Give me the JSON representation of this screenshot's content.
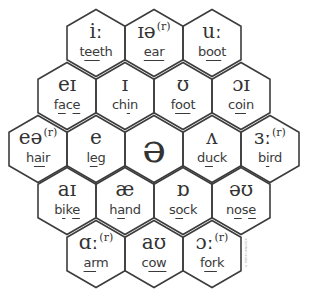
{
  "diagram": {
    "title": "",
    "type": "phonemic-chart-vowels-hexagon",
    "stroke_color": "#3c3c3c",
    "text_color": "#333333",
    "background": "#ffffff",
    "rows": [
      {
        "row": 0,
        "cells": [
          {
            "id": "teeth",
            "symbol": "iː",
            "sup": "",
            "word": "teeth",
            "parts": [
              [
                "t",
                false
              ],
              [
                "ee",
                true
              ],
              [
                "th",
                false
              ]
            ]
          },
          {
            "id": "ear",
            "symbol": "ɪə",
            "sup": "(r)",
            "word": "ear",
            "parts": [
              [
                "ear",
                true
              ]
            ]
          },
          {
            "id": "boot",
            "symbol": "uː",
            "sup": "",
            "word": "boot",
            "parts": [
              [
                "b",
                false
              ],
              [
                "oo",
                true
              ],
              [
                "t",
                false
              ]
            ]
          }
        ]
      },
      {
        "row": 1,
        "cells": [
          {
            "id": "face",
            "symbol": "eɪ",
            "sup": "",
            "word": "face",
            "parts": [
              [
                "f",
                false
              ],
              [
                "a",
                true
              ],
              [
                "c",
                false
              ],
              [
                "e",
                true
              ]
            ]
          },
          {
            "id": "chin",
            "symbol": "ɪ",
            "sup": "",
            "word": "chin",
            "parts": [
              [
                "ch",
                false
              ],
              [
                "i",
                true
              ],
              [
                "n",
                false
              ]
            ]
          },
          {
            "id": "foot",
            "symbol": "ʊ",
            "sup": "",
            "word": "foot",
            "parts": [
              [
                "f",
                false
              ],
              [
                "oo",
                true
              ],
              [
                "t",
                false
              ]
            ]
          },
          {
            "id": "coin",
            "symbol": "ɔɪ",
            "sup": "",
            "word": "coin",
            "parts": [
              [
                "c",
                false
              ],
              [
                "oi",
                true
              ],
              [
                "n",
                false
              ]
            ]
          }
        ]
      },
      {
        "row": 2,
        "cells": [
          {
            "id": "hair",
            "symbol": "eə",
            "sup": "(r)",
            "word": "hair",
            "parts": [
              [
                "h",
                false
              ],
              [
                "ai",
                true
              ],
              [
                "r",
                false
              ]
            ]
          },
          {
            "id": "leg",
            "symbol": "e",
            "sup": "",
            "word": "leg",
            "parts": [
              [
                "l",
                false
              ],
              [
                "e",
                true
              ],
              [
                "g",
                false
              ]
            ]
          },
          {
            "id": "schwa",
            "symbol": "ə",
            "sup": "",
            "word": "",
            "parts": [],
            "center": true
          },
          {
            "id": "duck",
            "symbol": "ʌ",
            "sup": "",
            "word": "duck",
            "parts": [
              [
                "d",
                false
              ],
              [
                "u",
                true
              ],
              [
                "ck",
                false
              ]
            ]
          },
          {
            "id": "bird",
            "symbol": "ɜː",
            "sup": "(r)",
            "word": "bird",
            "parts": [
              [
                "b",
                false
              ],
              [
                "i",
                true
              ],
              [
                "rd",
                false
              ]
            ]
          }
        ]
      },
      {
        "row": 3,
        "cells": [
          {
            "id": "bike",
            "symbol": "aɪ",
            "sup": "",
            "word": "bike",
            "parts": [
              [
                "b",
                false
              ],
              [
                "i",
                true
              ],
              [
                "k",
                false
              ],
              [
                "e",
                true
              ]
            ]
          },
          {
            "id": "hand",
            "symbol": "æ",
            "sup": "",
            "word": "hand",
            "parts": [
              [
                "h",
                false
              ],
              [
                "a",
                true
              ],
              [
                "nd",
                false
              ]
            ]
          },
          {
            "id": "sock",
            "symbol": "ɒ",
            "sup": "",
            "word": "sock",
            "parts": [
              [
                "s",
                false
              ],
              [
                "o",
                true
              ],
              [
                "ck",
                false
              ]
            ]
          },
          {
            "id": "nose",
            "symbol": "əʊ",
            "sup": "",
            "word": "nose",
            "parts": [
              [
                "n",
                false
              ],
              [
                "o",
                true
              ],
              [
                "s",
                false
              ],
              [
                "e",
                true
              ]
            ]
          }
        ]
      },
      {
        "row": 4,
        "cells": [
          {
            "id": "arm",
            "symbol": "ɑː",
            "sup": "(r)",
            "word": "arm",
            "parts": [
              [
                "ar",
                true
              ],
              [
                "m",
                false
              ]
            ]
          },
          {
            "id": "cow",
            "symbol": "aʊ",
            "sup": "",
            "word": "cow",
            "parts": [
              [
                "c",
                false
              ],
              [
                "ow",
                true
              ]
            ]
          },
          {
            "id": "fork",
            "symbol": "ɔː",
            "sup": "(r)",
            "word": "fork",
            "parts": [
              [
                "f",
                false
              ],
              [
                "or",
                true
              ],
              [
                "k",
                false
              ]
            ]
          }
        ]
      }
    ],
    "credit": "© MARK HANCOCK"
  }
}
